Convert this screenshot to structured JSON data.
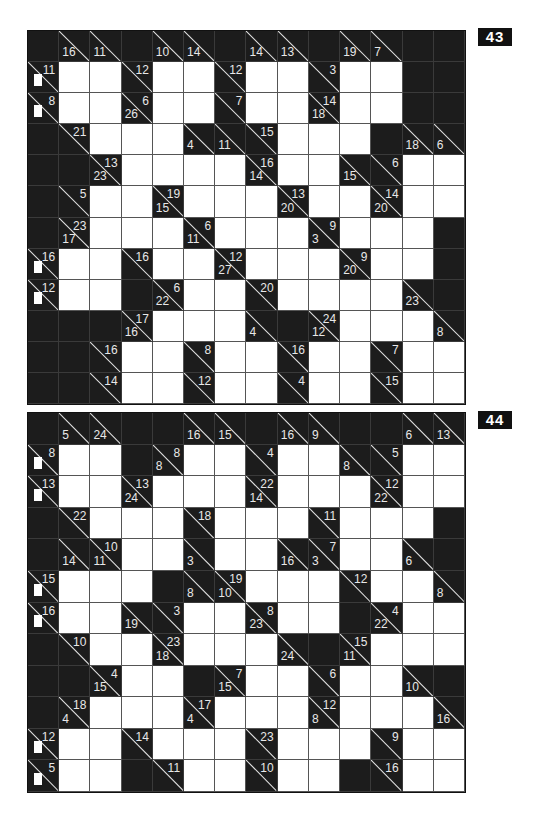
{
  "puzzles": [
    {
      "number": "43",
      "cols": 14,
      "rows": 12,
      "grid": [
        [
          "B",
          "D16",
          "D11",
          "B",
          "D10",
          "D14",
          "B",
          "D14",
          "D13",
          "B",
          "D19",
          "D7",
          "B",
          "B"
        ],
        [
          "R11",
          "W",
          "W",
          "R12",
          "W",
          "W",
          "R12",
          "W",
          "W",
          "R3",
          "W",
          "W",
          "B",
          "B"
        ],
        [
          "R8",
          "W",
          "W",
          "D26R6",
          "W",
          "W",
          "R7",
          "W",
          "W",
          "D18R14",
          "W",
          "W",
          "B",
          "B"
        ],
        [
          "B",
          "R21",
          "W",
          "W",
          "W",
          "D4",
          "D11",
          "R15",
          "W",
          "W",
          "W",
          "B",
          "D18",
          "D6"
        ],
        [
          "B",
          "B",
          "D23R13",
          "W",
          "W",
          "W",
          "W",
          "D14R16",
          "W",
          "W",
          "D15",
          "R6",
          "W",
          "W"
        ],
        [
          "B",
          "R5",
          "W",
          "W",
          "D15R19",
          "W",
          "W",
          "W",
          "D20R13",
          "W",
          "W",
          "D20R14",
          "W",
          "W"
        ],
        [
          "B",
          "D17R23",
          "W",
          "W",
          "W",
          "D11R6",
          "W",
          "W",
          "W",
          "D3R9",
          "W",
          "W",
          "W",
          "B"
        ],
        [
          "R16",
          "W",
          "W",
          "R16",
          "W",
          "W",
          "D27R12",
          "W",
          "W",
          "W",
          "D20R9",
          "W",
          "W",
          "B"
        ],
        [
          "R12",
          "W",
          "W",
          "B",
          "D22R6",
          "W",
          "W",
          "R20",
          "W",
          "W",
          "W",
          "W",
          "D23",
          "B"
        ],
        [
          "B",
          "B",
          "B",
          "D16R17",
          "W",
          "W",
          "W",
          "D4",
          "B",
          "D12R24",
          "W",
          "W",
          "W",
          "D8"
        ],
        [
          "B",
          "B",
          "R16",
          "W",
          "W",
          "R8",
          "W",
          "W",
          "R16",
          "W",
          "W",
          "R7",
          "W",
          "W"
        ],
        [
          "B",
          "B",
          "R14",
          "W",
          "W",
          "R12",
          "W",
          "W",
          "R4",
          "W",
          "W",
          "R15",
          "W",
          "W"
        ]
      ],
      "patches": [
        [
          1,
          0
        ],
        [
          2,
          0
        ],
        [
          7,
          0
        ],
        [
          8,
          0
        ]
      ]
    },
    {
      "number": "44",
      "cols": 14,
      "rows": 12,
      "grid": [
        [
          "B",
          "D5",
          "D24",
          "B",
          "B",
          "D16",
          "D15",
          "B",
          "D16",
          "D9",
          "B",
          "B",
          "D6",
          "D13"
        ],
        [
          "R8",
          "W",
          "W",
          "B",
          "D8R8",
          "W",
          "W",
          "R4",
          "W",
          "W",
          "D8",
          "R5",
          "W",
          "W"
        ],
        [
          "R13",
          "W",
          "W",
          "D24R13",
          "W",
          "W",
          "W",
          "D14R22",
          "W",
          "W",
          "W",
          "D22R12",
          "W",
          "W"
        ],
        [
          "B",
          "R22",
          "W",
          "W",
          "W",
          "R18",
          "W",
          "W",
          "W",
          "R11",
          "W",
          "W",
          "W",
          "B"
        ],
        [
          "B",
          "D14",
          "D11R10",
          "W",
          "W",
          "D3",
          "W",
          "W",
          "D16",
          "D3R7",
          "W",
          "W",
          "D6",
          "B"
        ],
        [
          "R15",
          "W",
          "W",
          "W",
          "B",
          "D8",
          "D10R19",
          "W",
          "W",
          "W",
          "R12",
          "W",
          "W",
          "D8"
        ],
        [
          "R16",
          "W",
          "W",
          "D19",
          "R3",
          "W",
          "W",
          "D23R8",
          "W",
          "W",
          "B",
          "D22R4",
          "W",
          "W"
        ],
        [
          "B",
          "R10",
          "W",
          "W",
          "D18R23",
          "W",
          "W",
          "W",
          "D24",
          "B",
          "D11R15",
          "W",
          "W",
          "W"
        ],
        [
          "B",
          "B",
          "D15R4",
          "W",
          "W",
          "B",
          "D15R7",
          "W",
          "W",
          "R6",
          "W",
          "W",
          "D10",
          "B"
        ],
        [
          "B",
          "D4R18",
          "W",
          "W",
          "W",
          "D4R17",
          "W",
          "W",
          "W",
          "D8R12",
          "W",
          "W",
          "W",
          "D16"
        ],
        [
          "R12",
          "W",
          "W",
          "R14",
          "W",
          "W",
          "W",
          "R23",
          "W",
          "W",
          "W",
          "R9",
          "W",
          "W"
        ],
        [
          "R5",
          "W",
          "W",
          "B",
          "R11",
          "W",
          "W",
          "R10",
          "W",
          "W",
          "B",
          "R16",
          "W",
          "W"
        ]
      ],
      "patches": [
        [
          1,
          0
        ],
        [
          2,
          0
        ],
        [
          5,
          0
        ],
        [
          6,
          0
        ],
        [
          10,
          0
        ],
        [
          11,
          0
        ]
      ]
    }
  ],
  "colors": {
    "block": "#1c1c1c",
    "white": "#ffffff",
    "clue_text": "#e8e8e8",
    "label_bg": "#111111"
  }
}
